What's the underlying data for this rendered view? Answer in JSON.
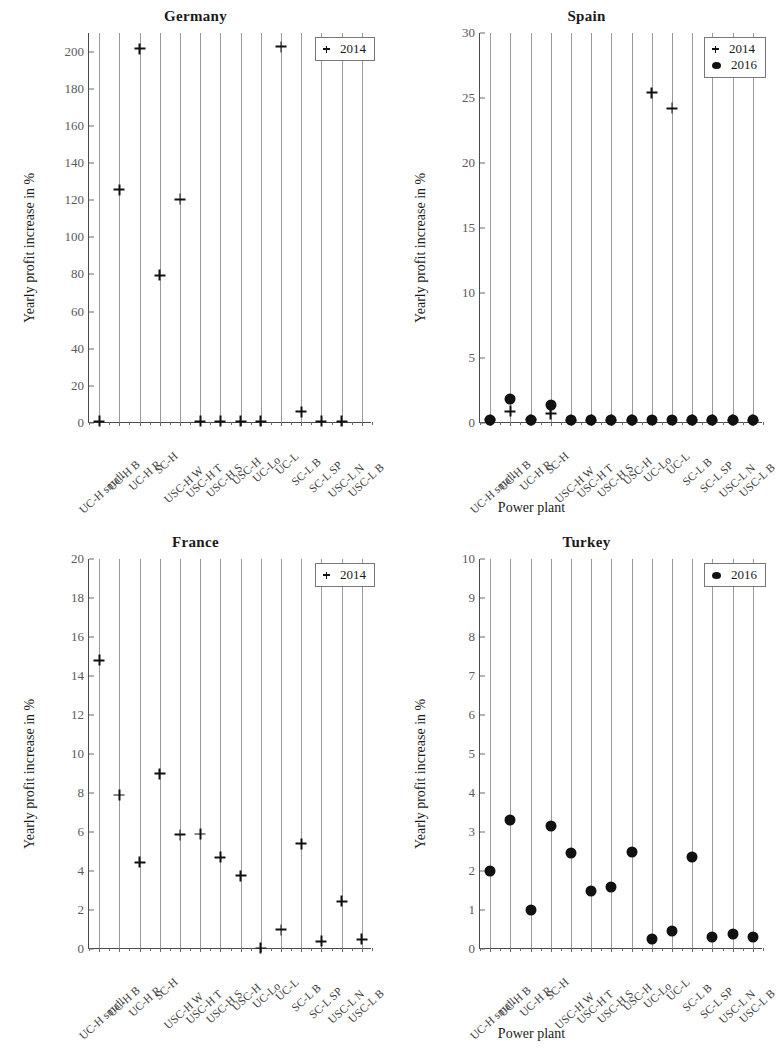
{
  "figure": {
    "xlabel": "Power plant",
    "ylabel": "Yearly profit increase in %",
    "categories": [
      "UC-H small",
      "UC-H B",
      "UC-H R",
      "SC-H",
      "USC-H W",
      "USC-H T",
      "USC-H S",
      "USC-H",
      "UC-Lo",
      "UC-L",
      "SC-L B",
      "SC-L SP",
      "USC-L N",
      "USC-L B"
    ],
    "series_labels": {
      "y2014": "2014",
      "y2016": "2016"
    }
  },
  "chart_data": [
    {
      "type": "scatter",
      "title": "Germany",
      "xlabel": "Power plant",
      "ylabel": "Yearly profit increase in %",
      "categories": [
        "UC-H small",
        "UC-H B",
        "UC-H R",
        "SC-H",
        "USC-H W",
        "USC-H T",
        "USC-H S",
        "USC-H",
        "UC-Lo",
        "UC-L",
        "SC-L B",
        "SC-L SP",
        "USC-L N",
        "USC-L B"
      ],
      "ylim": [
        0,
        210
      ],
      "yticks": [
        0,
        20,
        40,
        60,
        80,
        100,
        120,
        140,
        160,
        180,
        200
      ],
      "grid": true,
      "legend": [
        "2014"
      ],
      "legend_position": "top-right",
      "series": [
        {
          "name": "2014",
          "marker": "cross",
          "values": [
            1.0,
            125.5,
            201.5,
            79.5,
            120.5,
            1.0,
            1.0,
            1.0,
            1.0,
            202.5,
            6.0,
            1.0,
            1.0,
            null
          ]
        }
      ]
    },
    {
      "type": "scatter",
      "title": "Spain",
      "xlabel": "Power plant",
      "ylabel": "Yearly profit increase in %",
      "categories": [
        "UC-H small",
        "UC-H B",
        "UC-H R",
        "SC-H",
        "USC-H W",
        "USC-H T",
        "USC-H S",
        "USC-H",
        "UC-Lo",
        "UC-L",
        "SC-L B",
        "SC-L SP",
        "USC-L N",
        "USC-L B"
      ],
      "ylim": [
        0,
        30
      ],
      "yticks": [
        0,
        5,
        10,
        15,
        20,
        25,
        30
      ],
      "grid": true,
      "legend": [
        "2014",
        "2016"
      ],
      "legend_position": "top-right",
      "series": [
        {
          "name": "2014",
          "marker": "cross",
          "values": [
            0.25,
            0.9,
            0.25,
            0.7,
            0.2,
            0.2,
            0.2,
            0.2,
            25.4,
            24.2,
            0.2,
            0.2,
            0.2,
            0.2
          ]
        },
        {
          "name": "2016",
          "marker": "dot",
          "values": [
            0.2,
            1.85,
            0.2,
            1.35,
            0.2,
            0.2,
            0.2,
            0.2,
            0.2,
            0.2,
            0.25,
            0.2,
            0.2,
            0.2
          ]
        }
      ]
    },
    {
      "type": "scatter",
      "title": "France",
      "xlabel": "Power plant",
      "ylabel": "Yearly profit increase in %",
      "categories": [
        "UC-H small",
        "UC-H B",
        "UC-H R",
        "SC-H",
        "USC-H W",
        "USC-H T",
        "USC-H S",
        "USC-H",
        "UC-Lo",
        "UC-L",
        "SC-L B",
        "SC-L SP",
        "USC-L N",
        "USC-L B"
      ],
      "ylim": [
        0,
        20
      ],
      "yticks": [
        0,
        2,
        4,
        6,
        8,
        10,
        12,
        14,
        16,
        18,
        20
      ],
      "grid": true,
      "legend": [
        "2014"
      ],
      "legend_position": "top-right",
      "series": [
        {
          "name": "2014",
          "marker": "cross",
          "values": [
            14.8,
            7.9,
            4.45,
            9.0,
            5.85,
            5.9,
            4.7,
            3.75,
            0.05,
            1.0,
            5.4,
            0.4,
            2.45,
            0.5
          ]
        }
      ]
    },
    {
      "type": "scatter",
      "title": "Turkey",
      "xlabel": "Power plant",
      "ylabel": "Yearly profit increase in %",
      "categories": [
        "UC-H small",
        "UC-H B",
        "UC-H R",
        "SC-H",
        "USC-H W",
        "USC-H T",
        "USC-H S",
        "USC-H",
        "UC-Lo",
        "UC-L",
        "SC-L B",
        "SC-L SP",
        "USC-L N",
        "USC-L B"
      ],
      "ylim": [
        0,
        10
      ],
      "yticks": [
        0,
        1,
        2,
        3,
        4,
        5,
        6,
        7,
        8,
        9,
        10
      ],
      "grid": true,
      "legend": [
        "2016"
      ],
      "legend_position": "top-right",
      "series": [
        {
          "name": "2016",
          "marker": "dot",
          "values": [
            2.0,
            3.3,
            1.0,
            3.15,
            2.45,
            1.5,
            1.6,
            2.5,
            0.25,
            0.45,
            2.35,
            0.3,
            0.38,
            0.32
          ]
        }
      ]
    }
  ]
}
